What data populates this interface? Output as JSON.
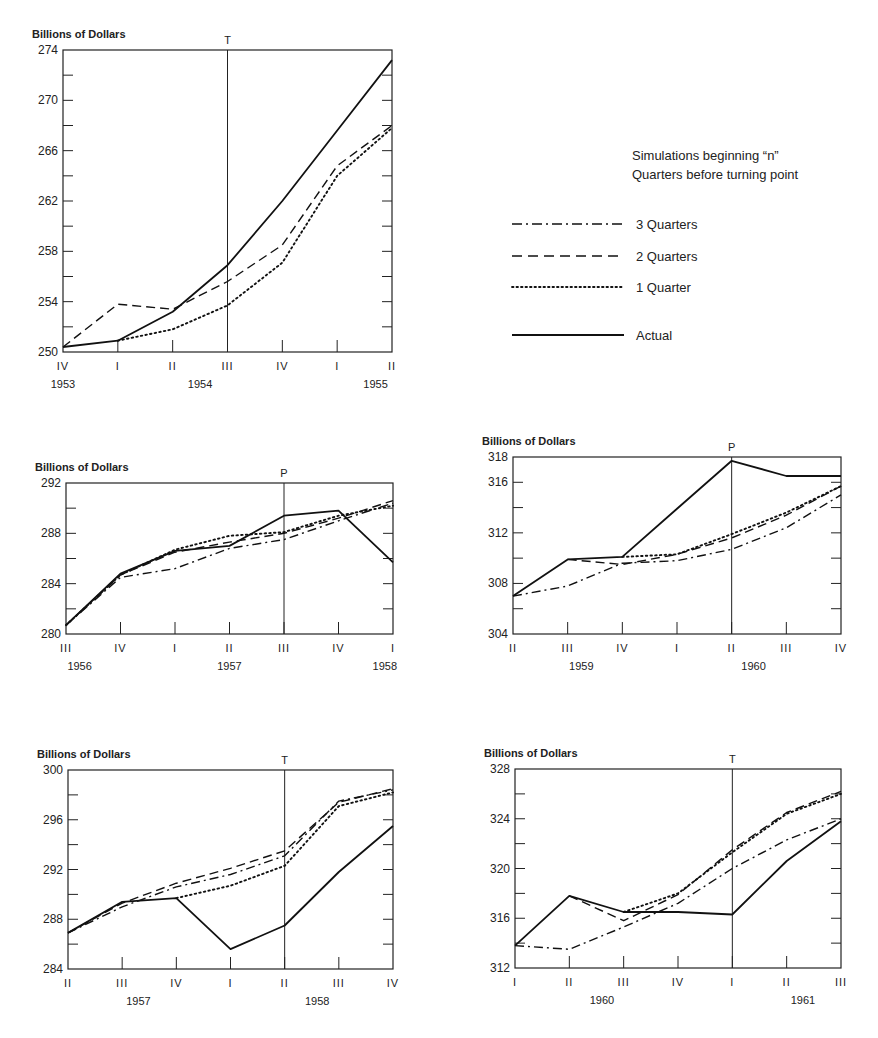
{
  "legend": {
    "title_lines": [
      "Simulations beginning “n”",
      "Quarters before turning point"
    ],
    "items": [
      {
        "label": "3 Quarters",
        "style": "dashdot"
      },
      {
        "label": "2 Quarters",
        "style": "dashed"
      },
      {
        "label": "1 Quarter",
        "style": "dotted"
      },
      {
        "label": "Actual",
        "style": "solid"
      }
    ]
  },
  "chart_data": [
    {
      "type": "line",
      "title": "",
      "ylabel": "Billions of Dollars",
      "ylim": [
        250,
        274
      ],
      "yticks": [
        250,
        254,
        258,
        262,
        266,
        270,
        274
      ],
      "minor_step": 2,
      "categories": [
        "IV",
        "I",
        "II",
        "III",
        "IV",
        "I",
        "II"
      ],
      "years": [
        {
          "label": "1953",
          "at": 0
        },
        {
          "label": "1954",
          "at": 2.5
        },
        {
          "label": "1955",
          "at": 5.7
        }
      ],
      "marker": {
        "label": "T",
        "at": 3
      },
      "box": {
        "x0": 63,
        "x1": 392,
        "y0": 50,
        "y1": 352
      },
      "series": [
        {
          "name": "Actual",
          "style": "solid",
          "start": 0,
          "values": [
            250.4,
            250.9,
            253.2,
            256.9,
            262.0,
            267.6,
            273.2
          ]
        },
        {
          "name": "2 Quarters",
          "style": "dashed",
          "start": 0,
          "values": [
            250.4,
            253.8,
            253.4,
            255.6,
            258.5,
            264.8,
            268.0
          ]
        },
        {
          "name": "1 Quarter",
          "style": "dotted",
          "start": 1,
          "values": [
            250.9,
            251.8,
            253.7,
            257.1,
            264.0,
            267.8
          ]
        }
      ]
    },
    {
      "type": "line",
      "title": "",
      "ylabel": "Billions of Dollars",
      "ylim": [
        280,
        292
      ],
      "yticks": [
        280,
        284,
        288,
        292
      ],
      "minor_step": 2,
      "categories": [
        "III",
        "IV",
        "I",
        "II",
        "III",
        "IV",
        "I"
      ],
      "years": [
        {
          "label": "1956",
          "at": 0.25
        },
        {
          "label": "1957",
          "at": 3
        },
        {
          "label": "1958",
          "at": 5.85
        }
      ],
      "marker": {
        "label": "P",
        "at": 4
      },
      "box": {
        "x0": 66,
        "x1": 393,
        "y0": 483,
        "y1": 634
      },
      "series": [
        {
          "name": "Actual",
          "style": "solid",
          "start": 0,
          "values": [
            280.7,
            284.8,
            286.6,
            287.0,
            289.4,
            289.8,
            285.7
          ]
        },
        {
          "name": "3 Quarters",
          "style": "dashdot",
          "start": 0,
          "values": [
            280.7,
            284.5,
            285.2,
            286.8,
            287.5,
            289.0,
            290.4
          ]
        },
        {
          "name": "2 Quarters",
          "style": "dashed",
          "start": 0,
          "values": [
            280.7,
            284.7,
            286.5,
            287.3,
            288.0,
            289.2,
            290.6
          ]
        },
        {
          "name": "1 Quarter",
          "style": "dotted",
          "start": 0,
          "values": [
            280.7,
            284.7,
            286.7,
            287.8,
            288.1,
            289.4,
            290.2
          ]
        }
      ]
    },
    {
      "type": "line",
      "title": "",
      "ylabel": "Billions of Dollars",
      "ylim": [
        304,
        318
      ],
      "yticks": [
        304,
        308,
        312,
        316,
        318
      ],
      "minor_step": 2,
      "categories": [
        "II",
        "III",
        "IV",
        "I",
        "II",
        "III",
        "IV"
      ],
      "years": [
        {
          "label": "1959",
          "at": 1.25
        },
        {
          "label": "1960",
          "at": 4.4
        }
      ],
      "marker": {
        "label": "P",
        "at": 4
      },
      "box": {
        "x0": 513,
        "x1": 841,
        "y0": 457,
        "y1": 634
      },
      "series": [
        {
          "name": "Actual",
          "style": "solid",
          "start": 0,
          "values": [
            307.0,
            309.9,
            310.1,
            313.9,
            317.7,
            316.5,
            316.5
          ]
        },
        {
          "name": "3 Quarters",
          "style": "dashdot",
          "start": 0,
          "values": [
            307.0,
            307.8,
            309.6,
            309.8,
            310.7,
            312.4,
            315.0
          ]
        },
        {
          "name": "2 Quarters",
          "style": "dashed",
          "start": 1,
          "values": [
            309.9,
            309.5,
            310.3,
            311.6,
            313.4,
            315.7
          ]
        },
        {
          "name": "1 Quarter",
          "style": "dotted",
          "start": 2,
          "values": [
            310.1,
            310.3,
            311.9,
            313.6,
            315.7
          ]
        }
      ]
    },
    {
      "type": "line",
      "title": "",
      "ylabel": "Billions of Dollars",
      "ylim": [
        284,
        300
      ],
      "yticks": [
        284,
        288,
        292,
        296,
        300
      ],
      "minor_step": 2,
      "categories": [
        "II",
        "III",
        "IV",
        "I",
        "II",
        "III",
        "IV"
      ],
      "years": [
        {
          "label": "1957",
          "at": 1.3
        },
        {
          "label": "1958",
          "at": 4.6
        }
      ],
      "marker": {
        "label": "T",
        "at": 4
      },
      "box": {
        "x0": 68,
        "x1": 393,
        "y0": 770,
        "y1": 969
      },
      "series": [
        {
          "name": "Actual",
          "style": "solid",
          "start": 0,
          "values": [
            286.9,
            289.4,
            289.7,
            285.6,
            287.5,
            291.8,
            295.5
          ]
        },
        {
          "name": "3 Quarters",
          "style": "dashdot",
          "start": 0,
          "values": [
            286.9,
            289.0,
            290.6,
            291.6,
            293.1,
            297.5,
            298.4
          ]
        },
        {
          "name": "2 Quarters",
          "style": "dashed",
          "start": 0,
          "values": [
            286.9,
            289.3,
            290.9,
            292.1,
            293.5,
            297.4,
            298.5
          ]
        },
        {
          "name": "1 Quarter",
          "style": "dotted",
          "start": 2,
          "values": [
            289.7,
            290.7,
            292.3,
            297.1,
            298.2
          ]
        }
      ]
    },
    {
      "type": "line",
      "title": "",
      "ylabel": "Billions of Dollars",
      "ylim": [
        312,
        328
      ],
      "yticks": [
        312,
        316,
        320,
        324,
        328
      ],
      "minor_step": 2,
      "categories": [
        "I",
        "II",
        "III",
        "IV",
        "I",
        "II",
        "III"
      ],
      "years": [
        {
          "label": "1960",
          "at": 1.6
        },
        {
          "label": "1961",
          "at": 5.3
        }
      ],
      "marker": {
        "label": "T",
        "at": 4
      },
      "box": {
        "x0": 515,
        "x1": 841,
        "y0": 769,
        "y1": 968
      },
      "series": [
        {
          "name": "Actual",
          "style": "solid",
          "start": 0,
          "values": [
            313.8,
            317.8,
            316.5,
            316.5,
            316.3,
            320.6,
            323.8
          ]
        },
        {
          "name": "3 Quarters",
          "style": "dashdot",
          "start": 0,
          "values": [
            313.8,
            313.5,
            315.3,
            317.2,
            320.0,
            322.3,
            324.0
          ]
        },
        {
          "name": "2 Quarters",
          "style": "dashed",
          "start": 1,
          "values": [
            317.8,
            315.8,
            317.9,
            321.5,
            324.5,
            326.2
          ]
        },
        {
          "name": "1 Quarter",
          "style": "dotted",
          "start": 2,
          "values": [
            316.5,
            318.0,
            321.3,
            324.4,
            326.0
          ]
        }
      ]
    }
  ]
}
